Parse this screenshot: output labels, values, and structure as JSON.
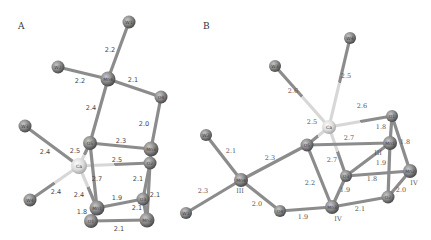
{
  "figure": {
    "panels": [
      {
        "label": "A",
        "label_pos": [
          18,
          29
        ],
        "style": "sans",
        "atoms": [
          {
            "id": "W1",
            "label": "W1",
            "x": 129,
            "y": 22,
            "r": 6.5,
            "kind": "water"
          },
          {
            "id": "W2",
            "label": "W2",
            "x": 58,
            "y": 67,
            "r": 6.5,
            "kind": "water"
          },
          {
            "id": "Mn4",
            "label": "Mn4",
            "x": 108,
            "y": 79,
            "r": 7.5,
            "kind": "mn"
          },
          {
            "id": "O4",
            "label": "O4",
            "x": 161,
            "y": 97,
            "r": 6.5,
            "kind": "oxygen"
          },
          {
            "id": "W3",
            "label": "W3",
            "x": 25,
            "y": 126,
            "r": 6.5,
            "kind": "water"
          },
          {
            "id": "O5",
            "label": "O5",
            "x": 90,
            "y": 143,
            "r": 7,
            "kind": "oxygen"
          },
          {
            "id": "Mn3",
            "label": "Mn3",
            "x": 151,
            "y": 149,
            "r": 7.5,
            "kind": "mn"
          },
          {
            "id": "Ca",
            "label": "Ca",
            "x": 79,
            "y": 166,
            "r": 8,
            "kind": "ca"
          },
          {
            "id": "O2",
            "label": "O2",
            "x": 150,
            "y": 163,
            "r": 6.5,
            "kind": "oxygen"
          },
          {
            "id": "W4",
            "label": "W4",
            "x": 30,
            "y": 200,
            "r": 6.5,
            "kind": "water"
          },
          {
            "id": "O3",
            "label": "O3",
            "x": 143,
            "y": 199,
            "r": 6.5,
            "kind": "oxygen"
          },
          {
            "id": "Mn1",
            "label": "Mn1",
            "x": 97,
            "y": 208,
            "r": 7.5,
            "kind": "mn"
          },
          {
            "id": "O1",
            "label": "O1",
            "x": 91,
            "y": 221,
            "r": 7,
            "kind": "oxygen"
          },
          {
            "id": "Mn2",
            "label": "Mn2",
            "x": 147,
            "y": 220,
            "r": 7.5,
            "kind": "mn"
          }
        ],
        "bonds": [
          {
            "a": "W1",
            "b": "Mn4",
            "label": "2.2",
            "lx": 110,
            "ly": 52
          },
          {
            "a": "W2",
            "b": "Mn4",
            "label": "2.2",
            "lx": 80,
            "ly": 83
          },
          {
            "a": "Mn4",
            "b": "O4",
            "label": "2.1",
            "lx": 133,
            "ly": 82
          },
          {
            "a": "Mn4",
            "b": "O5",
            "label": "2.4",
            "lx": 91,
            "ly": 110
          },
          {
            "a": "O4",
            "b": "Mn3",
            "label": "2.0",
            "lx": 144,
            "ly": 126
          },
          {
            "a": "O5",
            "b": "Mn3",
            "label": "2.3",
            "lx": 121,
            "ly": 143
          },
          {
            "a": "W3",
            "b": "Ca",
            "label": "2.4",
            "lx": 45,
            "ly": 154
          },
          {
            "a": "Ca",
            "b": "O5",
            "label": "2.5",
            "lx": 75,
            "ly": 153,
            "ca": true
          },
          {
            "a": "Ca",
            "b": "O2",
            "label": "2.5",
            "lx": 117,
            "ly": 162,
            "ca": true
          },
          {
            "a": "W4",
            "b": "Ca",
            "label": "2.4",
            "lx": 56,
            "ly": 194,
            "ca": true
          },
          {
            "a": "O5",
            "b": "Mn1",
            "label": "2.7",
            "lx": 97,
            "ly": 181
          },
          {
            "a": "Ca",
            "b": "Mn1",
            "label": "2.4",
            "lx": 79,
            "ly": 197,
            "ca": true
          },
          {
            "a": "Mn3",
            "b": "O2",
            "label": "",
            "lx": 0,
            "ly": 0
          },
          {
            "a": "O2",
            "b": "O3",
            "label": "2.1",
            "lx": 138,
            "ly": 181
          },
          {
            "a": "O2",
            "b": "Mn2",
            "label": "2.1",
            "lx": 155,
            "ly": 197
          },
          {
            "a": "Mn1",
            "b": "O3",
            "label": "1.9",
            "lx": 117,
            "ly": 200
          },
          {
            "a": "O3",
            "b": "Mn2",
            "label": "2.1",
            "lx": 137,
            "ly": 210
          },
          {
            "a": "Mn1",
            "b": "O1",
            "label": "1.8",
            "lx": 82,
            "ly": 214
          },
          {
            "a": "O1",
            "b": "Mn2",
            "label": "2.1",
            "lx": 119,
            "ly": 231
          }
        ],
        "ox_labels": []
      },
      {
        "label": "B",
        "label_pos": [
          203,
          29
        ],
        "style": "serif",
        "atoms": [
          {
            "id": "W4",
            "label": "W4",
            "x": 350,
            "y": 38,
            "r": 6,
            "kind": "water"
          },
          {
            "id": "W3",
            "label": "W3",
            "x": 275,
            "y": 66,
            "r": 6,
            "kind": "water"
          },
          {
            "id": "Ca",
            "label": "Ca",
            "x": 329,
            "y": 127,
            "r": 7,
            "kind": "ca"
          },
          {
            "id": "O1",
            "label": "O1",
            "x": 392,
            "y": 116,
            "r": 6,
            "kind": "oxygen"
          },
          {
            "id": "W2",
            "label": "W2",
            "x": 206,
            "y": 135,
            "r": 6,
            "kind": "water"
          },
          {
            "id": "O5",
            "label": "O5",
            "x": 307,
            "y": 145,
            "r": 6.5,
            "kind": "oxygen"
          },
          {
            "id": "Mn1",
            "label": "Mn1",
            "x": 390,
            "y": 143,
            "r": 7,
            "kind": "mn"
          },
          {
            "id": "O3",
            "label": "O3",
            "x": 346,
            "y": 176,
            "r": 6,
            "kind": "oxygen"
          },
          {
            "id": "Mn2",
            "label": "Mn2",
            "x": 410,
            "y": 171,
            "r": 7,
            "kind": "mn"
          },
          {
            "id": "Mn4",
            "label": "Mn4",
            "x": 241,
            "y": 180,
            "r": 7,
            "kind": "mn"
          },
          {
            "id": "W1",
            "label": "W1",
            "x": 186,
            "y": 213,
            "r": 6,
            "kind": "water"
          },
          {
            "id": "O2",
            "label": "O2",
            "x": 388,
            "y": 197,
            "r": 6.5,
            "kind": "oxygen"
          },
          {
            "id": "O4",
            "label": "O4",
            "x": 280,
            "y": 211,
            "r": 6,
            "kind": "oxygen"
          },
          {
            "id": "Mn3",
            "label": "Mn3",
            "x": 332,
            "y": 207,
            "r": 7,
            "kind": "mn"
          }
        ],
        "bonds": [
          {
            "a": "W4",
            "b": "Ca",
            "label": "2.5",
            "lx": 346,
            "ly": 78,
            "ca": true
          },
          {
            "a": "W3",
            "b": "Ca",
            "label": "2.6",
            "lx": 293,
            "ly": 93,
            "ca": true
          },
          {
            "a": "Ca",
            "b": "O1",
            "label": "2.6",
            "lx": 362,
            "ly": 108,
            "ca": true
          },
          {
            "a": "Ca",
            "b": "O5",
            "label": "2.5",
            "lx": 312,
            "ly": 124,
            "ca": true
          },
          {
            "a": "Ca",
            "b": "O3",
            "label": "2.7",
            "lx": 332,
            "ly": 162,
            "ca": true
          },
          {
            "a": "O1",
            "b": "Mn1",
            "label": "1.8",
            "lx": 381,
            "ly": 129
          },
          {
            "a": "O1",
            "b": "Mn2",
            "label": "1.8",
            "lx": 405,
            "ly": 144
          },
          {
            "a": "O5",
            "b": "Mn1",
            "label": "2.7",
            "lx": 349,
            "ly": 140
          },
          {
            "a": "W2",
            "b": "Mn4",
            "label": "2.1",
            "lx": 231,
            "ly": 153
          },
          {
            "a": "Mn4",
            "b": "O5",
            "label": "2.3",
            "lx": 270,
            "ly": 160
          },
          {
            "a": "W1",
            "b": "Mn4",
            "label": "2.3",
            "lx": 203,
            "ly": 193
          },
          {
            "a": "Mn4",
            "b": "O4",
            "label": "2.0",
            "lx": 257,
            "ly": 206
          },
          {
            "a": "O5",
            "b": "Mn3",
            "label": "2.2",
            "lx": 310,
            "ly": 185
          },
          {
            "a": "O3",
            "b": "Mn3",
            "label": "1.9",
            "lx": 345,
            "ly": 192
          },
          {
            "a": "Mn1",
            "b": "O3",
            "label": "",
            "lx": 0,
            "ly": 0
          },
          {
            "a": "O3",
            "b": "Mn2",
            "label": "1.8",
            "lx": 372,
            "ly": 181
          },
          {
            "a": "Mn1",
            "b": "O2",
            "label": "1.9",
            "lx": 381,
            "ly": 165
          },
          {
            "a": "Mn2",
            "b": "O2",
            "label": "2.0",
            "lx": 401,
            "ly": 192
          },
          {
            "a": "O4",
            "b": "Mn3",
            "label": "1.9",
            "lx": 303,
            "ly": 219
          },
          {
            "a": "Mn3",
            "b": "O2",
            "label": "2.1",
            "lx": 360,
            "ly": 211
          }
        ],
        "ox_labels": [
          {
            "text": "III",
            "x": 240,
            "y": 193
          },
          {
            "text": "III",
            "x": 378,
            "y": 155
          },
          {
            "text": "IV",
            "x": 414,
            "y": 185
          },
          {
            "text": "IV",
            "x": 338,
            "y": 221
          }
        ]
      }
    ]
  },
  "colors": {
    "background": "#ffffff",
    "bond": "#8c8c8c",
    "bond_ca": "#d7d7d7",
    "atom_dark": "#4a4a4a",
    "atom_mid": "#8a8a8a",
    "atom_light": "#bdbdbd",
    "ca_light": "#ececec",
    "ca_mid": "#c2c2c2"
  }
}
